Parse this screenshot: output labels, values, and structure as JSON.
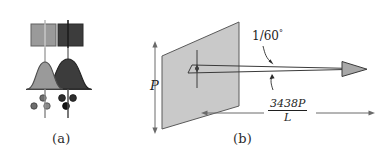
{
  "figure": {
    "type": "scientific-diagram",
    "background_color": "#ffffff",
    "ink_color": "#1f1f1f",
    "panels": [
      {
        "id": "a",
        "caption": "(a)",
        "description": "Two overlapping point-spread-function profiles with source squares and detector dots",
        "elements": {
          "squares": [
            {
              "name": "light-square",
              "fill": "#9a9a9a",
              "stroke": "#5a5a5a"
            },
            {
              "name": "dark-square",
              "fill": "#3c3c3c",
              "stroke": "#2a2a2a"
            }
          ],
          "curves": [
            {
              "name": "light-gaussian",
              "fill": "#9a9a9a",
              "stroke": "#4a4a4a"
            },
            {
              "name": "dark-gaussian",
              "fill": "#3c3c3c",
              "stroke": "#2a2a2a"
            }
          ],
          "axis_lines": 2,
          "dots": [
            {
              "shade": "dark"
            },
            {
              "shade": "dark"
            },
            {
              "shade": "dark"
            },
            {
              "shade": "light"
            },
            {
              "shade": "light"
            },
            {
              "shade": "light"
            }
          ]
        }
      },
      {
        "id": "b",
        "caption": "(b)",
        "description": "Pupil plane parallelogram with beam of light and angular resolution annotation",
        "labels": {
          "pupil": "P",
          "angle": "1/60",
          "angle_unit": "°",
          "formula_numerator": "3438P",
          "formula_denominator": "L"
        },
        "elements": {
          "plane": {
            "name": "pupil-plane",
            "fill": "#c9c9c9",
            "stroke": "#555555"
          },
          "beam_arrow": {
            "name": "light-ray-arrow",
            "direction": "right"
          },
          "extent_arrow": {
            "name": "distance-extent-arrow",
            "direction": "both"
          },
          "pupil_arrow": {
            "name": "pupil-height-arrow",
            "direction": "both"
          },
          "slit_arrow": {
            "name": "slit-height-arrow",
            "direction": "both"
          },
          "angle_pointers": 2
        }
      }
    ]
  }
}
